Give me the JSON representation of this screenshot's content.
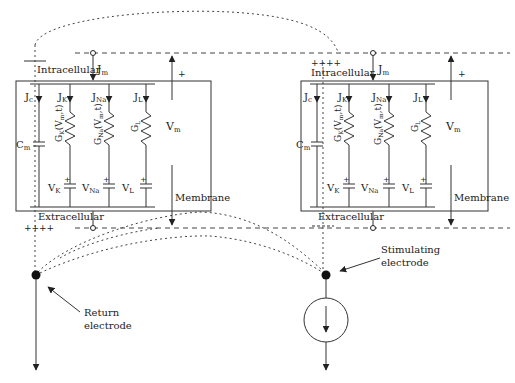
{
  "figure": {
    "cells": [
      {
        "id": "left",
        "labels": {
          "intracellular": "Intracellular",
          "extracellular": "Extracellular",
          "membrane": "Membrane",
          "jm": "J",
          "jm_sub": "m",
          "vm": "V",
          "vm_sub": "m",
          "plus": "+",
          "charges": "++++"
        },
        "branches": [
          {
            "current": "J",
            "current_sub": "c",
            "element": "C",
            "element_sub": "m",
            "type": "capacitor"
          },
          {
            "current": "J",
            "current_sub": "K",
            "conductance": "G",
            "conductance_sub": "K",
            "conductance_arg": "(V",
            "conductance_arg_sub": "m",
            "conductance_arg_end": ",t)",
            "battery": "V",
            "battery_sub": "K"
          },
          {
            "current": "J",
            "current_sub": "Na",
            "conductance": "G",
            "conductance_sub": "Na",
            "conductance_arg": "(V",
            "conductance_arg_sub": "m",
            "conductance_arg_end": ",t)",
            "battery": "V",
            "battery_sub": "Na"
          },
          {
            "current": "J",
            "current_sub": "L",
            "conductance": "G",
            "conductance_sub": "L",
            "battery": "V",
            "battery_sub": "L"
          }
        ]
      },
      {
        "id": "right",
        "labels": {
          "intracellular": "Intracellular",
          "extracellular": "Extracellular",
          "membrane": "Membrane",
          "jm": "J",
          "jm_sub": "m",
          "vm": "V",
          "vm_sub": "m",
          "plus": "+",
          "charges": "++++",
          "neg_charges": "- - - -"
        }
      }
    ],
    "electrodes": {
      "return": {
        "line1": "Return",
        "line2": "electrode"
      },
      "stimulating": {
        "line1": "Stimulating",
        "line2": "electrode"
      }
    },
    "battery_plus": "+",
    "colors": {
      "ink": "#222222",
      "background": "#ffffff"
    }
  }
}
